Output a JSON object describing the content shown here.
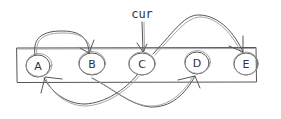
{
  "diagram": {
    "type": "linked-list-sketch",
    "container": {
      "x": 17,
      "y": 48,
      "width": 239,
      "height": 34
    },
    "nodes": [
      {
        "id": "A",
        "label": "A",
        "cx": 38,
        "cy": 66,
        "rx": 12,
        "ry": 11
      },
      {
        "id": "B",
        "label": "B",
        "cx": 92,
        "cy": 64,
        "rx": 13,
        "ry": 11
      },
      {
        "id": "C",
        "label": "C",
        "cx": 142,
        "cy": 64,
        "rx": 13,
        "ry": 11
      },
      {
        "id": "D",
        "label": "D",
        "cx": 197,
        "cy": 63,
        "rx": 12,
        "ry": 11
      },
      {
        "id": "E",
        "label": "E",
        "cx": 246,
        "cy": 64,
        "rx": 12,
        "ry": 11
      }
    ],
    "pointer": {
      "label": "cur",
      "target": "C"
    },
    "edges": [
      {
        "from": "A",
        "to": "B",
        "side": "top"
      },
      {
        "from": "C",
        "to": "E",
        "side": "top"
      },
      {
        "from": "B",
        "to": "D",
        "side": "bottom"
      },
      {
        "from": "C",
        "to": "A",
        "side": "bottom"
      }
    ],
    "colors": {
      "ink": "#555555",
      "ink_light": "#9a9a9a",
      "background": "#ffffff"
    }
  }
}
